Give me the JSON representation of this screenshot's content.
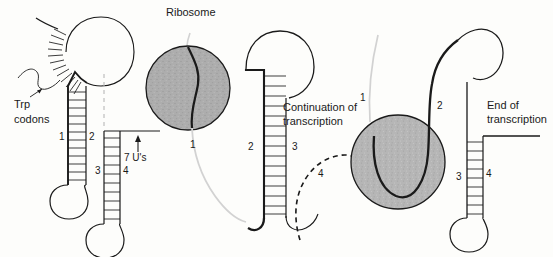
{
  "figure": {
    "background_color": "#fdfdfb",
    "line_color": "#1a1a1a",
    "ribosome_fill": "#a8a8a8",
    "ribosome_fill_light": "#b4b4b4",
    "mrna_light_color": "#cfcfcf"
  },
  "panels": [
    {
      "id": "panel-1",
      "labels": {
        "trp_codons": "Trp\ncodons",
        "trp_codons_line1": "Trp",
        "trp_codons_line2": "codons",
        "seven_us": "7 U's",
        "segment_1": "1",
        "segment_2": "2",
        "segment_3": "3",
        "segment_4": "4"
      }
    },
    {
      "id": "panel-2",
      "labels": {
        "ribosome": "Ribosome",
        "continuation_line1": "Continuation of",
        "continuation_line2": "transcription",
        "segment_1": "1",
        "segment_2": "2",
        "segment_3": "3",
        "segment_4": "4"
      }
    },
    {
      "id": "panel-3",
      "labels": {
        "end_line1": "End of",
        "end_line2": "transcription",
        "segment_1": "1",
        "segment_2": "2",
        "segment_3": "3",
        "segment_4": "4"
      }
    }
  ],
  "icons": {
    "ribosome_circle": "ribosome-icon",
    "hairpin_loop": "hairpin-loop-icon",
    "base_pair_ladder": "base-pair-ladder-icon",
    "up_arrow": "up-arrow-icon",
    "pointer_arrow": "pointer-arrow-icon",
    "dashed_strand": "dashed-strand-icon"
  }
}
